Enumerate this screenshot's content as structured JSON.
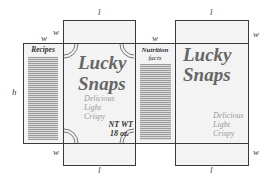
{
  "diagram": {
    "type": "cereal box net",
    "dimensions": {
      "length": "l",
      "width": "w",
      "height": "h"
    },
    "panels": {
      "left_side": {
        "label": "Recipes"
      },
      "front": {
        "brand_line1": "Lucky",
        "brand_line2": "Snaps",
        "taglines": [
          "Delicious",
          "Light",
          "Crispy"
        ],
        "net_weight_line1": "NT WT",
        "net_weight_line2": "18 oz."
      },
      "right_side": {
        "label_line1": "Nutrition",
        "label_line2": "facts"
      },
      "back": {
        "brand_line1": "Lucky",
        "brand_line2": "Snaps",
        "taglines": [
          "Delicious",
          "Light",
          "Crispy"
        ]
      }
    },
    "labels": {
      "top_l_front": "l",
      "top_l_back": "l",
      "bottom_l_front": "l",
      "bottom_l_back": "l",
      "w_left_top": "w",
      "w_front_top": "w",
      "w_middle_top": "w",
      "w_back_top_right": "w",
      "w_front_bottom": "w",
      "w_back_bottom_right": "w",
      "h_left": "h"
    },
    "colors": {
      "line": "#3a3a3a",
      "panel_fill": "#f3f3f3",
      "brand_text": "#666666",
      "tagline_text": "#999999"
    }
  }
}
